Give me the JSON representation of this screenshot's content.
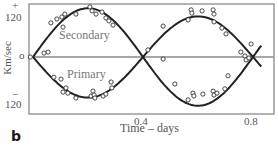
{
  "panel_label": "b",
  "chart_data": {
    "type": "scatter",
    "title": "",
    "xlabel": "Time – days",
    "ylabel": "Km/sec",
    "xlim": [
      -0.015,
      0.88
    ],
    "ylim": [
      -175,
      175
    ],
    "grid": false,
    "legend": "none (curves labeled inline)",
    "x_ticks": [
      {
        "value": 0.4,
        "label": "0.4"
      },
      {
        "value": 0.8,
        "label": "0.8"
      }
    ],
    "y_ticks": [
      {
        "value": 120,
        "label": "120",
        "sign": "+"
      },
      {
        "value": 0,
        "label": "o"
      },
      {
        "value": -120,
        "label": "120",
        "sign": "−"
      }
    ],
    "zero_line": true,
    "fitted_curves": [
      {
        "name": "Secondary",
        "shape": "sine",
        "amplitude": 150,
        "period": 0.8,
        "phase_zero": 0.0,
        "t_range": [
          0.0,
          0.83
        ]
      },
      {
        "name": "Primary",
        "shape": "sine",
        "amplitude": -125,
        "period": 0.8,
        "phase_zero": 0.0,
        "t_range": [
          0.0,
          0.83
        ]
      }
    ],
    "series": [
      {
        "name": "Secondary",
        "points": [
          [
            -0.01,
            0
          ],
          [
            0.04,
            12
          ],
          [
            0.055,
            15
          ],
          [
            0.065,
            105
          ],
          [
            0.087,
            117
          ],
          [
            0.105,
            123
          ],
          [
            0.109,
            92
          ],
          [
            0.116,
            132
          ],
          [
            0.156,
            132
          ],
          [
            0.207,
            154
          ],
          [
            0.215,
            142
          ],
          [
            0.229,
            132
          ],
          [
            0.251,
            138
          ],
          [
            0.265,
            120
          ],
          [
            0.276,
            111
          ],
          [
            0.291,
            98
          ],
          [
            0.418,
            22
          ],
          [
            0.473,
            95
          ],
          [
            0.564,
            114
          ],
          [
            0.575,
            145
          ],
          [
            0.578,
            135
          ],
          [
            0.615,
            142
          ],
          [
            0.655,
            145
          ],
          [
            0.658,
            132
          ],
          [
            0.658,
            108
          ],
          [
            0.687,
            89
          ],
          [
            0.702,
            71
          ],
          [
            0.756,
            15
          ],
          [
            0.793,
            40
          ]
        ]
      },
      {
        "name": "Primary",
        "points": [
          [
            0.076,
            -62
          ],
          [
            0.102,
            -68
          ],
          [
            0.109,
            -108
          ],
          [
            0.12,
            -95
          ],
          [
            0.127,
            -111
          ],
          [
            0.156,
            -126
          ],
          [
            0.211,
            -120
          ],
          [
            0.218,
            -105
          ],
          [
            0.222,
            -117
          ],
          [
            0.225,
            -126
          ],
          [
            0.255,
            -120
          ],
          [
            0.265,
            -114
          ],
          [
            0.287,
            -95
          ],
          [
            0.284,
            -77
          ],
          [
            0.473,
            -6
          ],
          [
            0.516,
            -83
          ],
          [
            0.564,
            -132
          ],
          [
            0.582,
            -111
          ],
          [
            0.585,
            -120
          ],
          [
            0.618,
            -114
          ],
          [
            0.655,
            -105
          ],
          [
            0.658,
            -117
          ],
          [
            0.669,
            -111
          ],
          [
            0.698,
            -98
          ],
          [
            0.709,
            -58
          ],
          [
            0.771,
            3
          ],
          [
            0.775,
            -9
          ],
          [
            0.785,
            -3
          ]
        ]
      }
    ],
    "annotations": [
      {
        "text": "Secondary",
        "x": 0.2,
        "y": 60
      },
      {
        "text": "Primary",
        "x": 0.19,
        "y": -60
      }
    ]
  },
  "labels": {
    "y_plus": "+",
    "y_top": "120",
    "y_zero": "o",
    "y_minus": "−",
    "y_bottom": "120",
    "x_tick_1": "0.4",
    "x_tick_2": "0.8",
    "xlabel": "Time – days",
    "ylabel": "Km/sec",
    "secondary": "Secondary",
    "primary": "Primary"
  },
  "colors": {
    "frame": "#8a8a8a",
    "curve": "#222222",
    "marker": "#333333",
    "text": "#555555"
  }
}
